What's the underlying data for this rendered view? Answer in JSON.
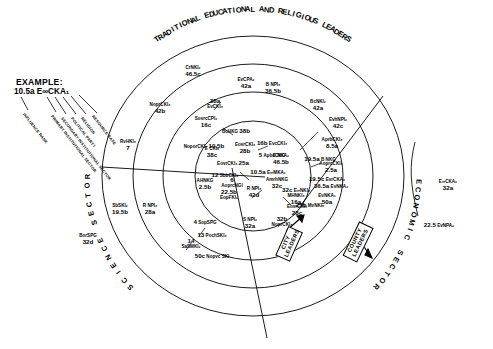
{
  "figure": {
    "type": "concentric-influence-sociogram",
    "ring_title_top": "TRADITIONAL EDUCATIONAL AND RELIGIOUS LEADERS",
    "sector_bottom_left": "SCIENCE SECTOR",
    "sector_bottom_right": "ECONOMIC SECTOR",
    "callout_city": "CITY\nLEADERS",
    "callout_city_line1": "CITY",
    "callout_city_line2": "LEADERS",
    "callout_county_line1": "COUNTY",
    "callout_county_line2": "LEADERS"
  },
  "legend": {
    "heading": "EXAMPLE:",
    "code": "10.5a E∞CKA₁",
    "keys": [
      "INFLUENCE RANK",
      "PRIMARY INSTITUTIONAL SECTOR",
      "SECONDARY INSTITUTIONAL SECTOR",
      "POLITICAL PARTY",
      "RELIGION",
      "RESOURCE BASE"
    ]
  },
  "nodes": [
    {
      "id": "n01",
      "code": "CrNKI₂",
      "rank": "46.5c",
      "x": 193,
      "y": 72,
      "layout": "stack"
    },
    {
      "id": "n02",
      "code": "NoprCKI₃",
      "rank": "42b",
      "x": 160,
      "y": 109,
      "layout": "stack"
    },
    {
      "id": "n03",
      "code": "EvCPA₂",
      "rank": "42a",
      "x": 246,
      "y": 84,
      "layout": "stack"
    },
    {
      "id": "n04",
      "code": "B NPI₃",
      "rank": "36.5b",
      "x": 273,
      "y": 89,
      "layout": "stack"
    },
    {
      "id": "n05",
      "code": "EvCKI₃",
      "rank": "38a",
      "x": 215,
      "y": 104,
      "layout": "stack-rev"
    },
    {
      "id": "n06",
      "code": "SovrcCPI₂",
      "rank": "16c",
      "x": 206,
      "y": 123,
      "layout": "stack"
    },
    {
      "id": "n07",
      "code": "BcHKG",
      "rank": "38b",
      "x": 236,
      "y": 131,
      "layout": "inline"
    },
    {
      "id": "n08",
      "code": "BcNKI₂",
      "rank": "42a",
      "x": 318,
      "y": 106,
      "layout": "stack"
    },
    {
      "id": "n09",
      "code": "EvhNPI₂",
      "rank": "42c",
      "x": 338,
      "y": 124,
      "layout": "stack"
    },
    {
      "id": "n10",
      "code": "NoporCKI₂",
      "rank": "10.5b",
      "x": 204,
      "y": 146,
      "layout": "inline"
    },
    {
      "id": "n11",
      "code": "E CKI₆",
      "rank": "38c",
      "x": 212,
      "y": 153,
      "layout": "stack"
    },
    {
      "id": "n12",
      "code": "EovrCKI₃",
      "rank": "28b",
      "x": 245,
      "y": 149,
      "layout": "stack"
    },
    {
      "id": "n13",
      "code": "EovrCKI₃",
      "rank": "25a",
      "x": 233,
      "y": 163,
      "layout": "inline"
    },
    {
      "id": "n14",
      "code": "EvcCKI₃",
      "rank": "16b",
      "x": 272,
      "y": 143,
      "layout": "inline-rev"
    },
    {
      "id": "n15",
      "code": "ApbcCKG",
      "rank": "5",
      "x": 272,
      "y": 155,
      "layout": "inline-rev"
    },
    {
      "id": "n16",
      "code": "AprbCKI₃",
      "rank": "8.5a",
      "x": 332,
      "y": 144,
      "layout": "stack"
    },
    {
      "id": "n17",
      "code": "B NKG",
      "rank": "19.5a",
      "x": 320,
      "y": 159,
      "layout": "inline-rev"
    },
    {
      "id": "n18",
      "code": "E NKA₂",
      "rank": "46.5b",
      "x": 281,
      "y": 160,
      "layout": "stack"
    },
    {
      "id": "n19",
      "code": "AoprcCKI₃",
      "rank": "2.5a",
      "x": 331,
      "y": 168,
      "layout": "stack"
    },
    {
      "id": "n20",
      "code": "SbbCKI₆",
      "rank": "12",
      "x": 225,
      "y": 175,
      "layout": "inline-rev"
    },
    {
      "id": "n21",
      "code": "E∞MKA₁",
      "rank": "10.5a",
      "x": 268,
      "y": 172,
      "layout": "inline-rev"
    },
    {
      "id": "n22",
      "code": "AHNKG",
      "rank": "2.5b",
      "x": 205,
      "y": 185,
      "layout": "stack"
    },
    {
      "id": "n23",
      "code": "AoprcNGI",
      "rank": "6",
      "x": 232,
      "y": 183,
      "layout": "stack-rev"
    },
    {
      "id": "n24",
      "code": "EvrCKA₂",
      "rank": "19.5c",
      "x": 327,
      "y": 179,
      "layout": "inline-rev"
    },
    {
      "id": "n25",
      "code": "EvNKA₂",
      "rank": "36.5a",
      "x": 331,
      "y": 186,
      "layout": "inline-rev"
    },
    {
      "id": "n26",
      "code": "AmrhNKG",
      "rank": "32c",
      "x": 277,
      "y": 184,
      "layout": "stack"
    },
    {
      "id": "n27",
      "code": "E∞NKI₂",
      "rank": "32c",
      "x": 296,
      "y": 190,
      "layout": "inline-rev"
    },
    {
      "id": "n28",
      "code": "EopFKI₂",
      "rank": "22.5b",
      "x": 229,
      "y": 195,
      "layout": "stack-rev"
    },
    {
      "id": "n29",
      "code": "R NPI₃",
      "rank": "42d",
      "x": 254,
      "y": 193,
      "layout": "stack"
    },
    {
      "id": "n30",
      "code": "MHNKI₃",
      "rank": "16a",
      "x": 296,
      "y": 200,
      "layout": "stack"
    },
    {
      "id": "n31",
      "code": "EvNKA₁",
      "rank": "50a",
      "x": 327,
      "y": 200,
      "layout": "stack"
    },
    {
      "id": "n32",
      "code": "MvNKI₅",
      "rank": "25b",
      "x": 310,
      "y": 205,
      "layout": "inline-rev"
    },
    {
      "id": "n33",
      "code": "EovrCKI₃",
      "rank": "28c",
      "x": 297,
      "y": 211,
      "layout": "stack"
    },
    {
      "id": "n34",
      "code": "NoprCKI₃",
      "rank": "32b",
      "x": 282,
      "y": 222,
      "layout": "stack-rev"
    },
    {
      "id": "n35",
      "code": "S NPI₂",
      "rank": "32a",
      "x": 250,
      "y": 224,
      "layout": "stack"
    },
    {
      "id": "n36",
      "code": "SopSPG",
      "rank": "4",
      "x": 205,
      "y": 222,
      "layout": "inline-rev"
    },
    {
      "id": "n37",
      "code": "PochSKI₃",
      "rank": "13",
      "x": 212,
      "y": 235,
      "layout": "inline-rev"
    },
    {
      "id": "n38",
      "code": "SaSMKI₂",
      "rank": "14",
      "x": 191,
      "y": 244,
      "layout": "stack-rev"
    },
    {
      "id": "n39",
      "code": "Nopvc SKI",
      "rank": "50c",
      "x": 212,
      "y": 256,
      "layout": "inline-rev"
    },
    {
      "id": "n40",
      "code": "RvHKI₃",
      "rank": "7",
      "x": 128,
      "y": 146,
      "layout": "stack"
    },
    {
      "id": "n41",
      "code": "SbSKI₂",
      "rank": "19.5b",
      "x": 120,
      "y": 210,
      "layout": "stack"
    },
    {
      "id": "n42",
      "code": "R NPI₃",
      "rank": "28a",
      "x": 150,
      "y": 210,
      "layout": "stack"
    },
    {
      "id": "n43",
      "code": "BorSPG",
      "rank": "32d",
      "x": 88,
      "y": 240,
      "layout": "stack"
    },
    {
      "id": "n44",
      "code": "E∞CKA₂",
      "rank": "32a",
      "x": 448,
      "y": 186,
      "layout": "stack"
    },
    {
      "id": "n45",
      "code": "EvNPA₂",
      "rank": "22.5",
      "x": 439,
      "y": 225,
      "layout": "inline-rev"
    }
  ]
}
